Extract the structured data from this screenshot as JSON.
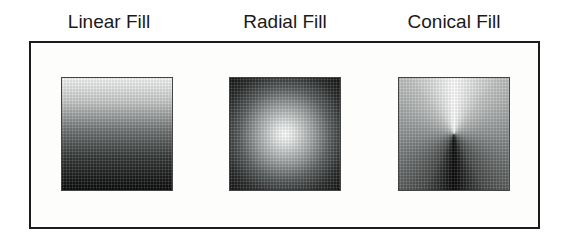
{
  "figure": {
    "panels": [
      {
        "label": "Linear Fill",
        "fill_type": "linear",
        "direction": "top-to-bottom",
        "colors": {
          "start": "#f6f6f6",
          "end": "#0c0c0c"
        }
      },
      {
        "label": "Radial Fill",
        "fill_type": "radial",
        "direction": "center-outward",
        "colors": {
          "start": "#ffffff",
          "end": "#141414"
        }
      },
      {
        "label": "Conical Fill",
        "fill_type": "conical",
        "direction": "white-at-top, dark-at-bottom",
        "colors": {
          "start": "#ffffff",
          "end": "#0a0a0a"
        }
      }
    ],
    "frame_color": "#1c1c1c",
    "background_color": "#ffffff"
  }
}
